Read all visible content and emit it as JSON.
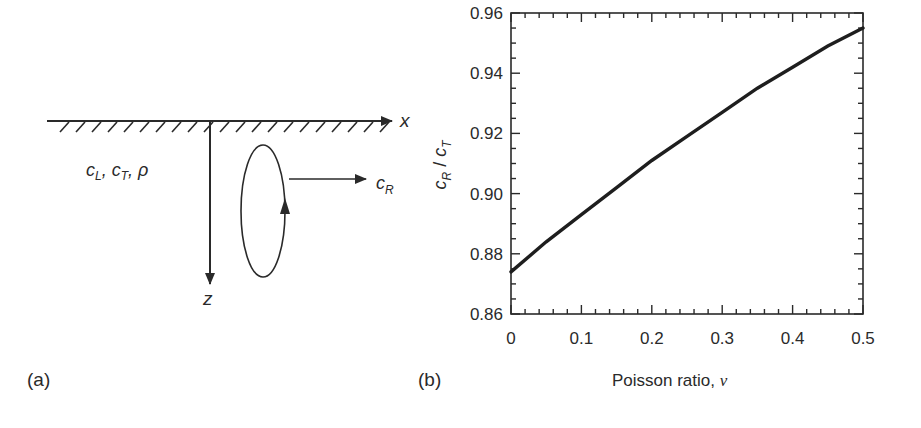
{
  "figure": {
    "panel_a": {
      "label": "(a)",
      "x_axis_label": "x",
      "z_axis_label": "z",
      "material_params": "c_L, c_T, ρ",
      "material_params_parts": [
        {
          "base": "c",
          "sub": "L",
          "sep": ", "
        },
        {
          "base": "c",
          "sub": "T",
          "sep": ", "
        },
        {
          "base": "ρ",
          "sub": "",
          "sep": ""
        }
      ],
      "wave_speed_label": {
        "base": "c",
        "sub": "R"
      },
      "description": "Half-space with free surface; elliptical particle motion of Rayleigh wave propagating in +x with speed c_R"
    },
    "panel_b": {
      "label": "(b)",
      "xlabel": "Poisson ratio, ν",
      "xlabel_text": "Poisson ratio, ",
      "xlabel_symbol": "ν",
      "ylabel": "c_R / c_T",
      "ylabel_parts": {
        "base1": "c",
        "sub1": "R",
        "slash": " / ",
        "base2": "c",
        "sub2": "T"
      }
    },
    "colors": {
      "ink": "#2a2a2a",
      "background": "#ffffff"
    }
  },
  "chart_data": {
    "type": "line",
    "title": "",
    "xlabel": "Poisson ratio, ν",
    "ylabel": "c_R / c_T",
    "xlim": [
      0,
      0.5
    ],
    "ylim": [
      0.86,
      0.96
    ],
    "x_ticks": [
      "0",
      "0.1",
      "0.2",
      "0.3",
      "0.4",
      "0.5"
    ],
    "y_ticks": [
      "0.86",
      "0.88",
      "0.90",
      "0.92",
      "0.94",
      "0.96"
    ],
    "grid": false,
    "legend": null,
    "series": [
      {
        "name": "c_R / c_T",
        "x": [
          0,
          0.05,
          0.1,
          0.15,
          0.2,
          0.25,
          0.3,
          0.35,
          0.4,
          0.45,
          0.5
        ],
        "y": [
          0.874,
          0.884,
          0.893,
          0.902,
          0.911,
          0.919,
          0.927,
          0.935,
          0.942,
          0.949,
          0.955
        ]
      }
    ]
  }
}
